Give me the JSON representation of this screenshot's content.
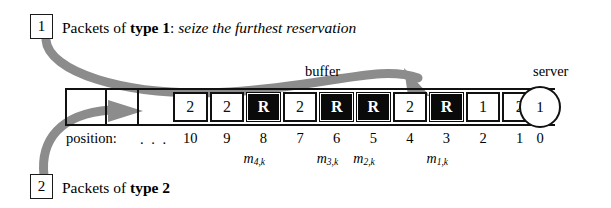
{
  "diagram": {
    "title_type1": {
      "box_label": "1",
      "prefix": "Packets of ",
      "bold": "type 1",
      "colon": ": ",
      "italic": "seize the furthest reservation"
    },
    "title_type2": {
      "box_label": "2",
      "prefix": "Packets of ",
      "bold": "type 2"
    },
    "buffer_label": "buffer",
    "server_label": "server",
    "server_value": "1",
    "position_label": "position:",
    "ellipsis": ". . .",
    "cells": [
      {
        "position": "10",
        "value": "2",
        "style": "light"
      },
      {
        "position": "9",
        "value": "2",
        "style": "light"
      },
      {
        "position": "8",
        "value": "R",
        "style": "dark"
      },
      {
        "position": "7",
        "value": "2",
        "style": "light"
      },
      {
        "position": "6",
        "value": "R",
        "style": "dark"
      },
      {
        "position": "5",
        "value": "R",
        "style": "dark"
      },
      {
        "position": "4",
        "value": "2",
        "style": "light"
      },
      {
        "position": "3",
        "value": "R",
        "style": "dark"
      },
      {
        "position": "2",
        "value": "1",
        "style": "light"
      },
      {
        "position": "1",
        "value": "2",
        "style": "light"
      }
    ],
    "server_position": "0",
    "reservation_marks": [
      {
        "base": "m",
        "sub": "4,k"
      },
      {
        "base": "m",
        "sub": "3,k"
      },
      {
        "base": "m",
        "sub": "2,k"
      },
      {
        "base": "m",
        "sub": "1,k"
      }
    ],
    "colors": {
      "arrow": "#8c8c8c",
      "ink": "#111111",
      "dark_cell": "#0a0a0a",
      "background": "#ffffff"
    }
  }
}
